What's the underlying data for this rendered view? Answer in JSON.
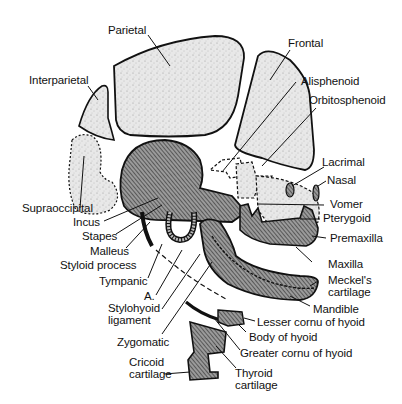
{
  "diagram": {
    "colors": {
      "membrane_bone_fill": "#e6e6e6",
      "cartilage_bone_fill": "#7a7a7a",
      "outline": "#111111",
      "background": "#ffffff"
    },
    "labels": {
      "parietal": "Parietal",
      "frontal": "Frontal",
      "interparietal": "Interparietal",
      "alisphenoid": "Alisphenoid",
      "orbitosphenoid": "Orbitosphenoid",
      "lacrimal": "Lacrimal",
      "nasal": "Nasal",
      "supraoccipital": "Supraoccipital",
      "vomer": "Vomer",
      "incus": "Incus",
      "pterygoid": "Pterygoid",
      "stapes": "Stapes",
      "premaxilla": "Premaxilla",
      "malleus": "Malleus",
      "styloid_process": "Styloid process",
      "tympanic": "Tympanic",
      "maxilla": "Maxilla",
      "meckels_cartilage": "Meckel's\ncartilage",
      "a": "A.",
      "mandible": "Mandible",
      "stylohyoid_ligament": "Stylohyoid\nligament",
      "zygomatic": "Zygomatic",
      "lesser_cornu": "Lesser cornu of hyoid",
      "body_of_hyoid": "Body of hyoid",
      "greater_cornu": "Greater cornu of hyoid",
      "cricoid_cartilage": "Cricoid\ncartilage",
      "thyroid_cartilage": "Thyroid\ncartilage"
    }
  }
}
